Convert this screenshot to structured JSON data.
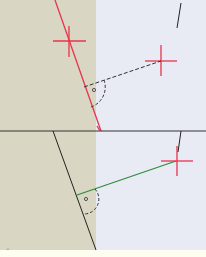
{
  "figure": {
    "colors": {
      "left_region": "#d9d6c3",
      "right_region": "#e8eaf4",
      "red": "#e8344a",
      "black": "#222222",
      "green": "#2e8b3a",
      "background": "#fdfdf0"
    },
    "top_panel": {
      "line": "red oblique line",
      "crosses": 2,
      "right_angle_symbol": "arc with dot"
    },
    "bottom_panel": {
      "line": "black oblique line",
      "perpendicular": "green segment",
      "crosses": 1,
      "right_angle_symbol": "arc with dot"
    },
    "footer_mark": "¨"
  }
}
